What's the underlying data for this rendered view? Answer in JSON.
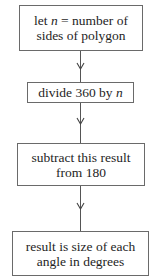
{
  "flowchart": {
    "steps": [
      {
        "line1_pre": "let ",
        "line1_var": "n",
        "line1_post": " = number of",
        "line2": "sides of polygon"
      },
      {
        "line1_pre": "divide 360 by ",
        "line1_var": "n"
      },
      {
        "line1": "subtract this result",
        "line2": "from 180"
      },
      {
        "line1": "result is size of each",
        "line2": "angle in degrees"
      }
    ],
    "colors": {
      "border": "#6a6a6a",
      "line": "#555555",
      "text": "#1e1e1e",
      "background": "#ffffff"
    }
  }
}
